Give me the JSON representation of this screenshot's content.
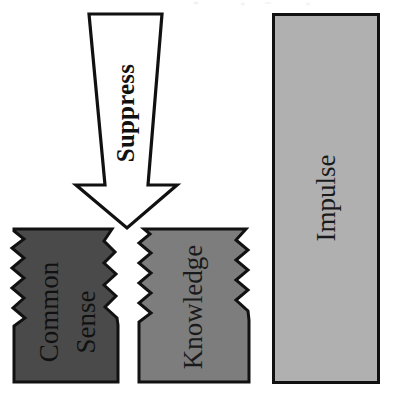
{
  "figure": {
    "background_color": "#ffffff",
    "width": 393,
    "height": 401,
    "outline_color": "#111111"
  },
  "arrow": {
    "label": "Suppress",
    "fill_color": "#ffffff",
    "stroke_color": "#111111",
    "direction": "down",
    "text_orientation": "rotated-90-ccw"
  },
  "blocks": [
    {
      "id": "common-sense",
      "label_lines": [
        "Common",
        "Sense"
      ],
      "label": "Common Sense",
      "fill_color": "#4a4a4a",
      "stroke_color": "#111111",
      "edges": "jagged-cracked",
      "text_orientation": "rotated-90-ccw"
    },
    {
      "id": "knowledge",
      "label_lines": [
        "Knowledge"
      ],
      "label": "Knowledge",
      "fill_color": "#7d7d7d",
      "stroke_color": "#111111",
      "edges": "jagged-cracked",
      "text_orientation": "rotated-90-ccw"
    },
    {
      "id": "impulse",
      "label_lines": [
        "Impulse"
      ],
      "label": "Impulse",
      "fill_color": "#b0b0b0",
      "stroke_color": "#111111",
      "edges": "straight-rectangle",
      "text_orientation": "rotated-90-ccw"
    }
  ]
}
